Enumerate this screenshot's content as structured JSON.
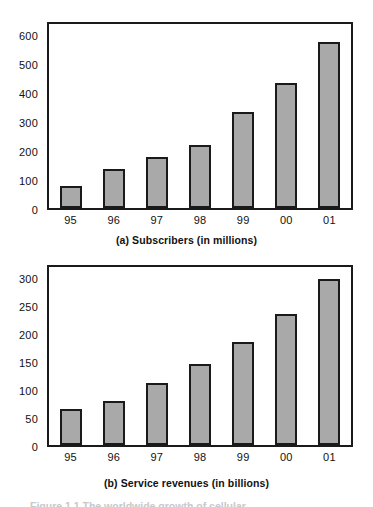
{
  "figure": {
    "bottom_caption_partial": "Figure 1.1   The worldwide growth of cellular"
  },
  "chart_data": [
    {
      "id": "subscribers",
      "type": "bar",
      "title": "(a) Subscribers (in millions)",
      "xlabel": "",
      "ylabel": "",
      "categories": [
        "95",
        "96",
        "97",
        "98",
        "99",
        "00",
        "01"
      ],
      "values": [
        78,
        138,
        180,
        222,
        338,
        442,
        588
      ],
      "yticks": [
        0,
        100,
        200,
        300,
        400,
        500,
        600
      ],
      "ylim": [
        0,
        650
      ],
      "grid": false,
      "legend": "none",
      "bar_fill": "#a9a9a9",
      "bar_edge": "#1a1a1a"
    },
    {
      "id": "service-revenues",
      "type": "bar",
      "title": "(b) Service revenues (in billions)",
      "xlabel": "",
      "ylabel": "",
      "categories": [
        "95",
        "96",
        "97",
        "98",
        "99",
        "00",
        "01"
      ],
      "values": [
        65,
        80,
        113,
        148,
        188,
        240,
        303
      ],
      "yticks": [
        0,
        50,
        100,
        150,
        200,
        250,
        300
      ],
      "ylim": [
        0,
        325
      ],
      "grid": false,
      "legend": "none",
      "bar_fill": "#a9a9a9",
      "bar_edge": "#1a1a1a"
    }
  ]
}
